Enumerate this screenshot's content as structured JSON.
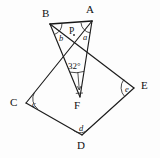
{
  "figure": {
    "type": "geometry-diagram",
    "background_color": "#fdfdfd",
    "line_color": "#1c1c1c",
    "vertices": [
      {
        "id": "A",
        "label": "A",
        "x": 92,
        "y": 21,
        "label_x": 86,
        "label_y": 4
      },
      {
        "id": "B",
        "label": "B",
        "x": 50,
        "y": 24,
        "label_x": 42,
        "label_y": 8
      },
      {
        "id": "C",
        "label": "C",
        "x": 26,
        "y": 103,
        "label_x": 10,
        "label_y": 97
      },
      {
        "id": "D",
        "label": "D",
        "x": 82,
        "y": 135,
        "label_x": 77,
        "label_y": 140
      },
      {
        "id": "E",
        "label": "E",
        "x": 134,
        "y": 88,
        "label_x": 141,
        "label_y": 80
      },
      {
        "id": "F",
        "label": "F",
        "x": 80,
        "y": 97,
        "label_x": 74,
        "label_y": 100
      },
      {
        "id": "P",
        "label": "P",
        "x": 74,
        "y": 35,
        "label_x": 69,
        "label_y": 27
      }
    ],
    "edges": [
      {
        "from": "B",
        "to": "A",
        "style": "thick"
      },
      {
        "from": "B",
        "to": "F",
        "style": "normal"
      },
      {
        "from": "A",
        "to": "F",
        "style": "normal"
      },
      {
        "from": "A",
        "to": "C",
        "style": "normal"
      },
      {
        "from": "B",
        "to": "E",
        "style": "normal"
      },
      {
        "from": "C",
        "to": "D",
        "style": "normal"
      },
      {
        "from": "D",
        "to": "E",
        "style": "normal"
      }
    ],
    "angle_marks": [
      {
        "id": "a",
        "label": "a",
        "at": "A",
        "label_x": 83,
        "label_y": 33
      },
      {
        "id": "b",
        "label": "b",
        "at": "B",
        "label_x": 59,
        "label_y": 34
      },
      {
        "id": "c",
        "label": "c",
        "at": "C",
        "label_x": 32,
        "label_y": 100
      },
      {
        "id": "d",
        "label": "d",
        "at": "D",
        "label_x": 79,
        "label_y": 124
      },
      {
        "id": "e",
        "label": "e",
        "at": "E",
        "label_x": 125,
        "label_y": 85
      },
      {
        "id": "f",
        "label": "32°",
        "at": "F",
        "label_x": 68,
        "label_y": 62
      }
    ],
    "angle_value": "32°",
    "intersection_point": "P"
  }
}
